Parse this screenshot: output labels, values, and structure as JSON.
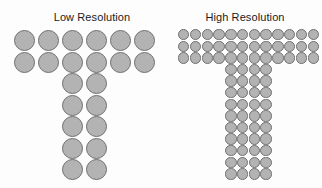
{
  "figure": {
    "background_color": "#fdfdfd",
    "dot_fill_color": "#b3b3b3",
    "dot_stroke_color": "#6f6f6f",
    "title_color": "#1b1b1b"
  },
  "panels": [
    {
      "id": "low-resolution",
      "title": "Low Resolution",
      "dot_label": "pixel-dot",
      "shape": "T",
      "bar_columns": 6,
      "bar_rows": 2,
      "stem_columns": 2,
      "stem_rows": 5,
      "stem_start_column": 3,
      "total_dots": 22,
      "matrix": [
        [
          1,
          1,
          1,
          1,
          1,
          1
        ],
        [
          1,
          1,
          1,
          1,
          1,
          1
        ],
        [
          0,
          0,
          1,
          1,
          0,
          0
        ],
        [
          0,
          0,
          1,
          1,
          0,
          0
        ],
        [
          0,
          0,
          1,
          1,
          0,
          0
        ],
        [
          0,
          0,
          1,
          1,
          0,
          0
        ],
        [
          0,
          0,
          1,
          1,
          0,
          0
        ]
      ]
    },
    {
      "id": "high-resolution",
      "title": "High Resolution",
      "dot_label": "pixel-dot",
      "shape": "T",
      "bar_columns": 12,
      "bar_rows": 3,
      "stem_columns": 4,
      "stem_rows": 10,
      "stem_start_column": 5,
      "total_dots": 76,
      "matrix": [
        [
          1,
          1,
          1,
          1,
          1,
          1,
          1,
          1,
          1,
          1,
          1,
          1
        ],
        [
          1,
          1,
          1,
          1,
          1,
          1,
          1,
          1,
          1,
          1,
          1,
          1
        ],
        [
          1,
          1,
          1,
          1,
          1,
          1,
          1,
          1,
          1,
          1,
          1,
          1
        ],
        [
          0,
          0,
          0,
          0,
          1,
          1,
          1,
          1,
          0,
          0,
          0,
          0
        ],
        [
          0,
          0,
          0,
          0,
          1,
          1,
          1,
          1,
          0,
          0,
          0,
          0
        ],
        [
          0,
          0,
          0,
          0,
          1,
          1,
          1,
          1,
          0,
          0,
          0,
          0
        ],
        [
          0,
          0,
          0,
          0,
          1,
          1,
          1,
          1,
          0,
          0,
          0,
          0
        ],
        [
          0,
          0,
          0,
          0,
          1,
          1,
          1,
          1,
          0,
          0,
          0,
          0
        ],
        [
          0,
          0,
          0,
          0,
          1,
          1,
          1,
          1,
          0,
          0,
          0,
          0
        ],
        [
          0,
          0,
          0,
          0,
          1,
          1,
          1,
          1,
          0,
          0,
          0,
          0
        ],
        [
          0,
          0,
          0,
          0,
          1,
          1,
          1,
          1,
          0,
          0,
          0,
          0
        ],
        [
          0,
          0,
          0,
          0,
          1,
          1,
          1,
          1,
          0,
          0,
          0,
          0
        ],
        [
          0,
          0,
          0,
          0,
          1,
          1,
          1,
          1,
          0,
          0,
          0,
          0
        ]
      ]
    }
  ]
}
